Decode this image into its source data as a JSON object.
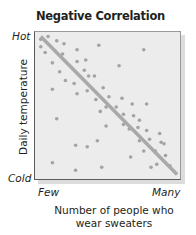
{
  "chart_data": {
    "type": "scatter",
    "title": "Negative Correlation",
    "xlabel": "Number of people who wear sweaters",
    "xlabel_lines": [
      "Number of people who",
      "wear sweaters"
    ],
    "ylabel": "Daily temperature",
    "x_tick_labels": [
      "Few",
      "Many"
    ],
    "y_tick_labels": [
      "Cold",
      "Hot"
    ],
    "x_range": [
      0,
      100
    ],
    "y_range": [
      0,
      100
    ],
    "grid": false,
    "legend": null,
    "trend_line": {
      "x": [
        4,
        98
      ],
      "y": [
        97,
        3
      ],
      "color": "#a9a9a9",
      "width": 3.5
    },
    "point_color": "#a3a3a3",
    "plot_background": "#ececec",
    "points": [
      {
        "x": 4,
        "y": 95
      },
      {
        "x": 9,
        "y": 97
      },
      {
        "x": 15,
        "y": 94
      },
      {
        "x": 4,
        "y": 90
      },
      {
        "x": 7,
        "y": 86
      },
      {
        "x": 20,
        "y": 92
      },
      {
        "x": 19,
        "y": 85
      },
      {
        "x": 12,
        "y": 79
      },
      {
        "x": 29,
        "y": 88
      },
      {
        "x": 29,
        "y": 80
      },
      {
        "x": 35,
        "y": 81
      },
      {
        "x": 44,
        "y": 91
      },
      {
        "x": 17,
        "y": 73
      },
      {
        "x": 34,
        "y": 74
      },
      {
        "x": 75,
        "y": 88
      },
      {
        "x": 58,
        "y": 77
      },
      {
        "x": 21,
        "y": 67
      },
      {
        "x": 37,
        "y": 70
      },
      {
        "x": 41,
        "y": 70
      },
      {
        "x": 12,
        "y": 61
      },
      {
        "x": 27,
        "y": 65
      },
      {
        "x": 29,
        "y": 58
      },
      {
        "x": 36,
        "y": 60
      },
      {
        "x": 47,
        "y": 62
      },
      {
        "x": 42,
        "y": 54
      },
      {
        "x": 51,
        "y": 56
      },
      {
        "x": 60,
        "y": 55
      },
      {
        "x": 49,
        "y": 49
      },
      {
        "x": 56,
        "y": 49
      },
      {
        "x": 67,
        "y": 51
      },
      {
        "x": 77,
        "y": 51
      },
      {
        "x": 61,
        "y": 44
      },
      {
        "x": 68,
        "y": 43
      },
      {
        "x": 72,
        "y": 40
      },
      {
        "x": 45,
        "y": 46
      },
      {
        "x": 61,
        "y": 37
      },
      {
        "x": 49,
        "y": 36
      },
      {
        "x": 15,
        "y": 41
      },
      {
        "x": 28,
        "y": 23
      },
      {
        "x": 36,
        "y": 22
      },
      {
        "x": 43,
        "y": 26
      },
      {
        "x": 65,
        "y": 34
      },
      {
        "x": 71,
        "y": 35
      },
      {
        "x": 77,
        "y": 33
      },
      {
        "x": 72,
        "y": 26
      },
      {
        "x": 79,
        "y": 27
      },
      {
        "x": 86,
        "y": 31
      },
      {
        "x": 87,
        "y": 25
      },
      {
        "x": 75,
        "y": 19
      },
      {
        "x": 83,
        "y": 19
      },
      {
        "x": 90,
        "y": 16
      },
      {
        "x": 89,
        "y": 24
      },
      {
        "x": 84,
        "y": 10
      },
      {
        "x": 93,
        "y": 9
      },
      {
        "x": 12,
        "y": 11
      },
      {
        "x": 46,
        "y": 8
      },
      {
        "x": 66,
        "y": 15
      },
      {
        "x": 80,
        "y": 8
      },
      {
        "x": 28,
        "y": 6
      }
    ]
  }
}
